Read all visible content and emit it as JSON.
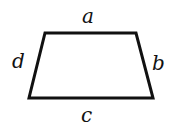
{
  "diagram": {
    "shape": "trapezoid",
    "stroke_color": "#111111",
    "vertices": [
      [
        45,
        33
      ],
      [
        136,
        33
      ],
      [
        153,
        98
      ],
      [
        29,
        98
      ]
    ],
    "labels": {
      "top": "a",
      "right": "b",
      "bottom": "c",
      "left": "d"
    }
  }
}
